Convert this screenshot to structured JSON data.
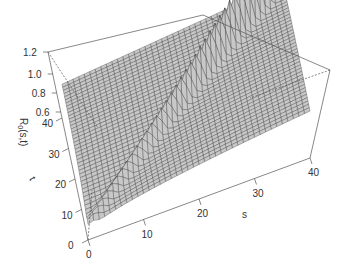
{
  "chart_data": {
    "type": "surface3d",
    "title": "",
    "zlabel": "R0(s,t)",
    "xlabel": "s",
    "ylabel": "t",
    "x_ticks": [
      0,
      10,
      20,
      30,
      40
    ],
    "y_ticks": [
      0,
      10,
      20,
      30,
      40
    ],
    "z_ticks": [
      0.6,
      0.8,
      1.0,
      1.2
    ],
    "xlim": [
      0,
      40
    ],
    "ylim": [
      0,
      40
    ],
    "zlim": [
      0.5,
      1.25
    ],
    "grid_resolution": 40,
    "surface_color": "#c8c8c8",
    "mesh_color": "#333333"
  },
  "axes": {
    "z_label_text": "R",
    "z_label_sub": "0",
    "z_label_rest": "(s,t)",
    "s_label": "s",
    "t_label": "t"
  }
}
